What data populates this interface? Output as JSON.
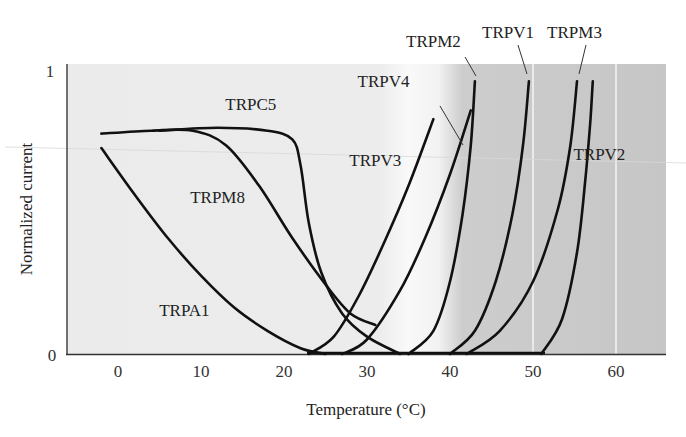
{
  "chart_data": {
    "type": "line",
    "title": "",
    "xlabel": "Temperature (°C)",
    "ylabel": "Normalized current",
    "xlim": [
      -6,
      66
    ],
    "ylim": [
      0,
      1
    ],
    "x_ticks": [
      0,
      10,
      20,
      30,
      40,
      50,
      60
    ],
    "y_ticks": [
      0,
      1
    ],
    "grid": false,
    "legend": "inline labels",
    "background_bands": [
      {
        "from": -6,
        "to": 34,
        "color": "#ebebeb",
        "meaning": "cool"
      },
      {
        "from": 34,
        "to": 42,
        "color": "#f7f7f7",
        "meaning": "warm (gradient)"
      },
      {
        "from": 42,
        "to": 66,
        "color": "#c8c8c8",
        "meaning": "hot"
      }
    ],
    "series": [
      {
        "name": "TRPA1",
        "points": [
          [
            -2,
            0.71
          ],
          [
            2,
            0.55
          ],
          [
            6,
            0.4
          ],
          [
            10,
            0.27
          ],
          [
            14,
            0.16
          ],
          [
            18,
            0.08
          ],
          [
            22,
            0.02
          ],
          [
            25,
            0.0
          ]
        ]
      },
      {
        "name": "TRPM8",
        "points": [
          [
            -2,
            0.76
          ],
          [
            4,
            0.77
          ],
          [
            9,
            0.77
          ],
          [
            13,
            0.72
          ],
          [
            17,
            0.58
          ],
          [
            21,
            0.4
          ],
          [
            25,
            0.24
          ],
          [
            28,
            0.14
          ],
          [
            31,
            0.1
          ]
        ]
      },
      {
        "name": "TRPC5",
        "points": [
          [
            5,
            0.77
          ],
          [
            12,
            0.78
          ],
          [
            18,
            0.77
          ],
          [
            21,
            0.74
          ],
          [
            22,
            0.65
          ],
          [
            23,
            0.45
          ],
          [
            24.5,
            0.28
          ],
          [
            27,
            0.14
          ],
          [
            30,
            0.06
          ],
          [
            34,
            0.0
          ]
        ]
      },
      {
        "name": "TRPV3",
        "points": [
          [
            23,
            0.0
          ],
          [
            26,
            0.06
          ],
          [
            29,
            0.2
          ],
          [
            32,
            0.38
          ],
          [
            35,
            0.58
          ],
          [
            38,
            0.81
          ]
        ]
      },
      {
        "name": "TRPV4",
        "points": [
          [
            27,
            0.0
          ],
          [
            30,
            0.05
          ],
          [
            34,
            0.22
          ],
          [
            37,
            0.4
          ],
          [
            40,
            0.62
          ],
          [
            42.5,
            0.84
          ]
        ]
      },
      {
        "name": "TRPM2",
        "points": [
          [
            35,
            0.0
          ],
          [
            38,
            0.08
          ],
          [
            40,
            0.25
          ],
          [
            41.5,
            0.48
          ],
          [
            42.5,
            0.72
          ],
          [
            43,
            0.94
          ]
        ]
      },
      {
        "name": "TRPV1",
        "points": [
          [
            40,
            0.0
          ],
          [
            43,
            0.08
          ],
          [
            45.5,
            0.25
          ],
          [
            47.5,
            0.48
          ],
          [
            48.8,
            0.72
          ],
          [
            49.5,
            0.94
          ]
        ]
      },
      {
        "name": "TRPM3",
        "points": [
          [
            42,
            0.0
          ],
          [
            46,
            0.08
          ],
          [
            50,
            0.25
          ],
          [
            53,
            0.5
          ],
          [
            54.5,
            0.72
          ],
          [
            55.3,
            0.94
          ]
        ]
      },
      {
        "name": "TRPV2",
        "points": [
          [
            51,
            0.0
          ],
          [
            53.5,
            0.12
          ],
          [
            55.3,
            0.35
          ],
          [
            56.3,
            0.6
          ],
          [
            56.9,
            0.8
          ],
          [
            57.2,
            0.94
          ]
        ]
      }
    ],
    "labels": [
      {
        "text": "TRPC5",
        "x": 16,
        "y": 0.84
      },
      {
        "text": "TRPM8",
        "x": 12,
        "y": 0.52
      },
      {
        "text": "TRPA1",
        "x": 8,
        "y": 0.13
      },
      {
        "text": "TRPV3",
        "x": 31,
        "y": 0.65
      },
      {
        "text": "TRPV4",
        "x": 32,
        "y": 0.92
      },
      {
        "text": "TRPM2",
        "x": 38,
        "y": 1.06
      },
      {
        "text": "TRPV1",
        "x": 47,
        "y": 1.09
      },
      {
        "text": "TRPM3",
        "x": 55,
        "y": 1.09
      },
      {
        "text": "TRPV2",
        "x": 58,
        "y": 0.67
      }
    ]
  }
}
